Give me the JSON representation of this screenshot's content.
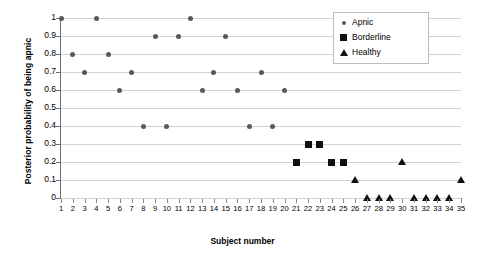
{
  "chart_data": {
    "type": "scatter",
    "title": "",
    "xlabel": "Subject number",
    "ylabel": "Posterior probability of being apnic",
    "xlim": [
      1,
      35
    ],
    "ylim": [
      0,
      1
    ],
    "grid": true,
    "legend_position": "top-right",
    "x_ticks": [
      1,
      2,
      3,
      4,
      5,
      6,
      7,
      8,
      9,
      10,
      11,
      12,
      13,
      14,
      15,
      16,
      17,
      18,
      19,
      20,
      21,
      22,
      23,
      24,
      25,
      26,
      27,
      28,
      29,
      30,
      31,
      32,
      33,
      34,
      35
    ],
    "y_ticks": [
      "0",
      "0.1",
      "0.2",
      "0.3",
      "0.4",
      "0.5",
      "0.6",
      "0.7",
      "0.8",
      "0.9",
      "1"
    ],
    "series": [
      {
        "name": "Apnic",
        "marker": "circle",
        "color": "#595959",
        "points": [
          {
            "x": 1,
            "y": 1.0
          },
          {
            "x": 2,
            "y": 0.8
          },
          {
            "x": 3,
            "y": 0.7
          },
          {
            "x": 4,
            "y": 1.0
          },
          {
            "x": 5,
            "y": 0.8
          },
          {
            "x": 6,
            "y": 0.6
          },
          {
            "x": 7,
            "y": 0.7
          },
          {
            "x": 8,
            "y": 0.4
          },
          {
            "x": 9,
            "y": 0.9
          },
          {
            "x": 10,
            "y": 0.4
          },
          {
            "x": 11,
            "y": 0.9
          },
          {
            "x": 12,
            "y": 1.0
          },
          {
            "x": 13,
            "y": 0.6
          },
          {
            "x": 14,
            "y": 0.7
          },
          {
            "x": 15,
            "y": 0.9
          },
          {
            "x": 16,
            "y": 0.6
          },
          {
            "x": 17,
            "y": 0.4
          },
          {
            "x": 18,
            "y": 0.7
          },
          {
            "x": 19,
            "y": 0.4
          },
          {
            "x": 20,
            "y": 0.6
          }
        ]
      },
      {
        "name": "Borderline",
        "marker": "square",
        "color": "#111111",
        "points": [
          {
            "x": 21,
            "y": 0.2
          },
          {
            "x": 22,
            "y": 0.3
          },
          {
            "x": 23,
            "y": 0.3
          },
          {
            "x": 24,
            "y": 0.2
          },
          {
            "x": 25,
            "y": 0.2
          }
        ]
      },
      {
        "name": "Healthy",
        "marker": "triangle",
        "color": "#111111",
        "points": [
          {
            "x": 26,
            "y": 0.1
          },
          {
            "x": 27,
            "y": 0.0
          },
          {
            "x": 28,
            "y": 0.0
          },
          {
            "x": 29,
            "y": 0.0
          },
          {
            "x": 30,
            "y": 0.2
          },
          {
            "x": 31,
            "y": 0.0
          },
          {
            "x": 32,
            "y": 0.0
          },
          {
            "x": 33,
            "y": 0.0
          },
          {
            "x": 34,
            "y": 0.0
          },
          {
            "x": 35,
            "y": 0.1
          }
        ]
      }
    ]
  },
  "legend": {
    "items": [
      {
        "label": "Apnic",
        "marker": "circle"
      },
      {
        "label": "Borderline",
        "marker": "square"
      },
      {
        "label": "Healthy",
        "marker": "triangle"
      }
    ]
  }
}
